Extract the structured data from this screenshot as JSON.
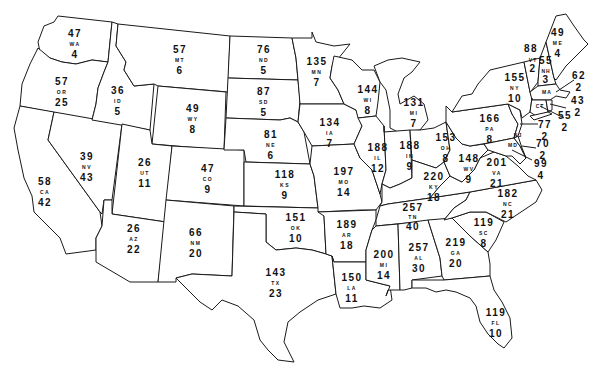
{
  "map": {
    "type": "us-states-choropleth-outline",
    "description": "Outline map of the contiguous United States; each state labeled with a top number, state abbreviation, and bottom number",
    "states": [
      {
        "abbr": "WA",
        "top": "47",
        "bottom": "4"
      },
      {
        "abbr": "OR",
        "top": "57",
        "bottom": "25"
      },
      {
        "abbr": "CA",
        "top": "58",
        "bottom": "42"
      },
      {
        "abbr": "ID",
        "top": "36",
        "bottom": "5"
      },
      {
        "abbr": "NV",
        "top": "39",
        "bottom": "43"
      },
      {
        "abbr": "MT",
        "top": "57",
        "bottom": "6"
      },
      {
        "abbr": "WY",
        "top": "49",
        "bottom": "8"
      },
      {
        "abbr": "UT",
        "top": "26",
        "bottom": "11"
      },
      {
        "abbr": "AZ",
        "top": "26",
        "bottom": "22"
      },
      {
        "abbr": "CO",
        "top": "47",
        "bottom": "9"
      },
      {
        "abbr": "NM",
        "top": "66",
        "bottom": "20"
      },
      {
        "abbr": "ND",
        "top": "76",
        "bottom": "5"
      },
      {
        "abbr": "SD",
        "top": "87",
        "bottom": "5"
      },
      {
        "abbr": "NE",
        "top": "81",
        "bottom": "6"
      },
      {
        "abbr": "KS",
        "top": "118",
        "bottom": "9"
      },
      {
        "abbr": "OK",
        "top": "151",
        "bottom": "10"
      },
      {
        "abbr": "TX",
        "top": "143",
        "bottom": "23"
      },
      {
        "abbr": "MN",
        "top": "135",
        "bottom": "7"
      },
      {
        "abbr": "IA",
        "top": "134",
        "bottom": "7"
      },
      {
        "abbr": "MO",
        "top": "197",
        "bottom": "14"
      },
      {
        "abbr": "AR",
        "top": "189",
        "bottom": "18"
      },
      {
        "abbr": "LA",
        "top": "150",
        "bottom": "11"
      },
      {
        "abbr": "WI",
        "top": "144",
        "bottom": "8"
      },
      {
        "abbr": "IL",
        "top": "188",
        "bottom": "12"
      },
      {
        "abbr": "MI",
        "top": "131",
        "bottom": "7"
      },
      {
        "abbr": "IN",
        "top": "188",
        "bottom": "9"
      },
      {
        "abbr": "OH",
        "top": "153",
        "bottom": "8"
      },
      {
        "abbr": "KY",
        "top": "220",
        "bottom": "18"
      },
      {
        "abbr": "TN",
        "top": "257",
        "bottom": "40"
      },
      {
        "abbr": "MS",
        "label": "MI",
        "top": "200",
        "bottom": "14"
      },
      {
        "abbr": "AL",
        "top": "257",
        "bottom": "30"
      },
      {
        "abbr": "GA",
        "top": "219",
        "bottom": "20"
      },
      {
        "abbr": "FL",
        "top": "119",
        "bottom": "10"
      },
      {
        "abbr": "SC",
        "top": "119",
        "bottom": "8"
      },
      {
        "abbr": "NC",
        "top": "182",
        "bottom": "21"
      },
      {
        "abbr": "VA",
        "top": "201",
        "bottom": "21"
      },
      {
        "abbr": "WV",
        "top": "148",
        "bottom": "9"
      },
      {
        "abbr": "PA",
        "top": "166",
        "bottom": "8"
      },
      {
        "abbr": "NY",
        "top": "155",
        "bottom": "10"
      },
      {
        "abbr": "VT",
        "top": "88",
        "bottom": "2"
      },
      {
        "abbr": "NH",
        "top": "55",
        "bottom": "3"
      },
      {
        "abbr": "ME",
        "top": "49",
        "bottom": "4"
      },
      {
        "abbr": "MA",
        "top": "62",
        "bottom": "2"
      },
      {
        "abbr": "RI",
        "top": "43",
        "bottom": "2"
      },
      {
        "abbr": "CT",
        "top": "55",
        "bottom": "2"
      },
      {
        "abbr": "NJ",
        "top": "77",
        "bottom": "2"
      },
      {
        "abbr": "DE",
        "top": "70",
        "bottom": "2"
      },
      {
        "abbr": "MD",
        "top": "99",
        "bottom": "4"
      }
    ]
  },
  "labels": {
    "WA": {
      "top": "47",
      "abbr": "WA",
      "bottom": "4"
    },
    "OR": {
      "top": "57",
      "abbr": "OR",
      "bottom": "25"
    },
    "CA": {
      "top": "58",
      "abbr": "CA",
      "bottom": "42"
    },
    "ID": {
      "top": "36",
      "abbr": "ID",
      "bottom": "5"
    },
    "NV": {
      "top": "39",
      "abbr": "NV",
      "bottom": "43"
    },
    "MT": {
      "top": "57",
      "abbr": "MT",
      "bottom": "6"
    },
    "WY": {
      "top": "49",
      "abbr": "WY",
      "bottom": "8"
    },
    "UT": {
      "top": "26",
      "abbr": "UT",
      "bottom": "11"
    },
    "AZ": {
      "top": "26",
      "abbr": "AZ",
      "bottom": "22"
    },
    "CO": {
      "top": "47",
      "abbr": "CO",
      "bottom": "9"
    },
    "NM": {
      "top": "66",
      "abbr": "NM",
      "bottom": "20"
    },
    "ND": {
      "top": "76",
      "abbr": "ND",
      "bottom": "5"
    },
    "SD": {
      "top": "87",
      "abbr": "SD",
      "bottom": "5"
    },
    "NE": {
      "top": "81",
      "abbr": "NE",
      "bottom": "6"
    },
    "KS": {
      "top": "118",
      "abbr": "KS",
      "bottom": "9"
    },
    "OK": {
      "top": "151",
      "abbr": "OK",
      "bottom": "10"
    },
    "TX": {
      "top": "143",
      "abbr": "TX",
      "bottom": "23"
    },
    "MN": {
      "top": "135",
      "abbr": "MN",
      "bottom": "7"
    },
    "IA": {
      "top": "134",
      "abbr": "IA",
      "bottom": "7"
    },
    "MO": {
      "top": "197",
      "abbr": "MO",
      "bottom": "14"
    },
    "AR": {
      "top": "189",
      "abbr": "AR",
      "bottom": "18"
    },
    "LA": {
      "top": "150",
      "abbr": "LA",
      "bottom": "11"
    },
    "WI": {
      "top": "144",
      "abbr": "WI",
      "bottom": "8"
    },
    "IL": {
      "top": "188",
      "abbr": "IL",
      "bottom": "12"
    },
    "MI": {
      "top": "131",
      "abbr": "MI",
      "bottom": "7"
    },
    "IN": {
      "top": "188",
      "abbr": "IN",
      "bottom": "9"
    },
    "OH": {
      "top": "153",
      "abbr": "OH",
      "bottom": "8"
    },
    "KY": {
      "top": "220",
      "abbr": "KY",
      "bottom": "18"
    },
    "TN": {
      "top": "257",
      "abbr": "TN",
      "bottom": "40"
    },
    "MS": {
      "top": "200",
      "abbr": "MI",
      "bottom": "14"
    },
    "AL": {
      "top": "257",
      "abbr": "AL",
      "bottom": "30"
    },
    "GA": {
      "top": "219",
      "abbr": "GA",
      "bottom": "20"
    },
    "FL": {
      "top": "119",
      "abbr": "FL",
      "bottom": "10"
    },
    "SC": {
      "top": "119",
      "abbr": "SC",
      "bottom": "8"
    },
    "NC": {
      "top": "182",
      "abbr": "NC",
      "bottom": "21"
    },
    "VA": {
      "top": "201",
      "abbr": "VA",
      "bottom": "21"
    },
    "WV": {
      "top": "148",
      "abbr": "WV",
      "bottom": "9"
    },
    "PA": {
      "top": "166",
      "abbr": "PA",
      "bottom": "8"
    },
    "NY": {
      "top": "155",
      "abbr": "NY",
      "bottom": "10"
    },
    "VT": {
      "top": "88",
      "abbr": "VT",
      "bottom": "2"
    },
    "NH": {
      "top": "55",
      "abbr": "NH",
      "bottom": "3"
    },
    "ME": {
      "top": "49",
      "abbr": "ME",
      "bottom": "4"
    },
    "MA": {
      "top": "62",
      "abbr": "MA",
      "bottom": "2"
    },
    "RI": {
      "top": "43",
      "abbr": "RI",
      "bottom": "2"
    },
    "CT": {
      "top": "55",
      "abbr": "CT",
      "bottom": "2"
    },
    "NJ": {
      "top": "77",
      "abbr": "NJ",
      "bottom": "2"
    },
    "DE": {
      "top": "70",
      "abbr": "DE",
      "bottom": "2"
    },
    "MD": {
      "top": "99",
      "abbr": "MD",
      "bottom": "4"
    }
  },
  "colors": {
    "stroke": "#1a1a1a",
    "fill": "#ffffff",
    "text": "#111111",
    "background": "#ffffff"
  }
}
